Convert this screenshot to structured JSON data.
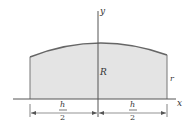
{
  "diagram": {
    "axes": {
      "x_label": "x",
      "y_label": "y"
    },
    "labels": {
      "center_height": "R",
      "edge_height": "r",
      "left_dim_numerator": "h",
      "left_dim_denominator": "2",
      "right_dim_numerator": "h",
      "right_dim_denominator": "2"
    },
    "colors": {
      "fill": "#e4e4e4",
      "outline": "#666666",
      "axis": "#555555"
    }
  }
}
